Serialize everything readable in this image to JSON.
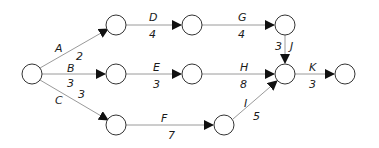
{
  "diagram": {
    "type": "activity-on-arrow network",
    "nodes": [
      {
        "id": "n0",
        "x": 32,
        "y": 74
      },
      {
        "id": "n1",
        "x": 116,
        "y": 25
      },
      {
        "id": "n2",
        "x": 116,
        "y": 74
      },
      {
        "id": "n3",
        "x": 116,
        "y": 125
      },
      {
        "id": "n4",
        "x": 192,
        "y": 25
      },
      {
        "id": "n5",
        "x": 192,
        "y": 74
      },
      {
        "id": "n6",
        "x": 224,
        "y": 125
      },
      {
        "id": "n7",
        "x": 285,
        "y": 25
      },
      {
        "id": "n8",
        "x": 285,
        "y": 74
      },
      {
        "id": "n9",
        "x": 345,
        "y": 74
      }
    ],
    "activities": [
      {
        "name": "A",
        "duration": "2",
        "from": "n0",
        "to": "n1"
      },
      {
        "name": "B",
        "duration": "3",
        "from": "n0",
        "to": "n2"
      },
      {
        "name": "C",
        "duration": "3",
        "from": "n0",
        "to": "n3"
      },
      {
        "name": "D",
        "duration": "4",
        "from": "n1",
        "to": "n4"
      },
      {
        "name": "E",
        "duration": "3",
        "from": "n2",
        "to": "n5"
      },
      {
        "name": "F",
        "duration": "7",
        "from": "n3",
        "to": "n6"
      },
      {
        "name": "G",
        "duration": "4",
        "from": "n4",
        "to": "n7"
      },
      {
        "name": "H",
        "duration": "8",
        "from": "n5",
        "to": "n8"
      },
      {
        "name": "I",
        "duration": "5",
        "from": "n6",
        "to": "n8"
      },
      {
        "name": "J",
        "duration": "3",
        "from": "n7",
        "to": "n8"
      },
      {
        "name": "K",
        "duration": "3",
        "from": "n8",
        "to": "n9"
      }
    ]
  },
  "labels": {
    "A": {
      "name": "A",
      "duration": "2"
    },
    "B": {
      "name": "B",
      "duration": "3"
    },
    "C": {
      "name": "C",
      "duration": "3"
    },
    "D": {
      "name": "D",
      "duration": "4"
    },
    "E": {
      "name": "E",
      "duration": "3"
    },
    "F": {
      "name": "F",
      "duration": "7"
    },
    "G": {
      "name": "G",
      "duration": "4"
    },
    "H": {
      "name": "H",
      "duration": "8"
    },
    "I": {
      "name": "I",
      "duration": "5"
    },
    "J": {
      "name": "J",
      "duration": "3"
    },
    "K": {
      "name": "K",
      "duration": "3"
    }
  },
  "colors": {
    "edge": "#9a9a9a",
    "node_stroke": "#333333",
    "arrowhead": "#111111",
    "text": "#1a1a1a"
  }
}
